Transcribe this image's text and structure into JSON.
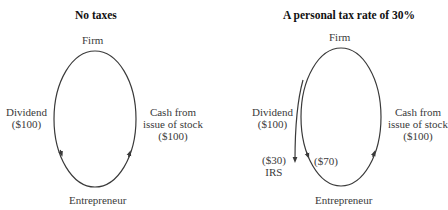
{
  "left_panel": {
    "title": "No taxes",
    "top_node": "Firm",
    "bottom_node": "Entrepreneur",
    "left_flow": [
      "Dividend",
      "($100)"
    ],
    "right_flow": [
      "Cash from",
      "issue of stock",
      "($100)"
    ]
  },
  "right_panel": {
    "title": "A personal tax rate of 30%",
    "top_node": "Firm",
    "bottom_node": "Entrepreneur",
    "left_flow": [
      "Dividend",
      "($100)"
    ],
    "right_flow": [
      "Cash from",
      "issue of stock",
      "($100)"
    ],
    "irs_flow": [
      "($30)",
      "IRS"
    ],
    "net_flow": "($70)"
  },
  "colors": {
    "line": "#3a3a3a",
    "text": "#333333"
  }
}
